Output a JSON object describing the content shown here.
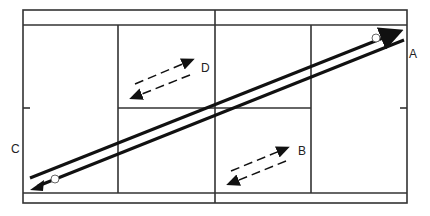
{
  "diagram": {
    "type": "badminton-court-shot-diagram",
    "labels": {
      "A": "A",
      "B": "B",
      "C": "C",
      "D": "D"
    },
    "markers": {
      "top_right": "Ⓤ",
      "bottom_left": "Ⓗ"
    },
    "colors": {
      "line": "#333333",
      "arrow": "#111111",
      "background": "#ffffff"
    }
  }
}
